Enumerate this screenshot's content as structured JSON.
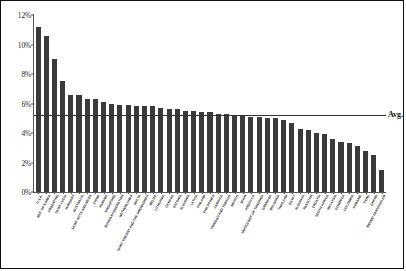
{
  "chart_data": {
    "type": "bar",
    "title": "",
    "xlabel": "",
    "ylabel": "",
    "ylim": [
      0,
      12
    ],
    "ytick_labels": [
      "0%",
      "2%",
      "4%",
      "6%",
      "8%",
      "10%",
      "12%"
    ],
    "ytick_values": [
      0,
      2,
      4,
      6,
      8,
      10,
      12
    ],
    "grid": false,
    "legend": "none",
    "bar_color": "#3a3a3a",
    "annotations": [
      {
        "name": "average-line",
        "label": "Avg. 5.20%",
        "value": 5.2,
        "orientation": "horizontal"
      }
    ],
    "categories": [
      "U.S.A.",
      "REP. OF KOREA",
      "ARGENTINA",
      "SAINT LUCIA",
      "HUNGARY",
      "AUSTRALIA",
      "SAINT KITTS AND NEVIS",
      "CHINA",
      "PANAMA",
      "SINGAPORE",
      "RUSSIAN FEDERATION",
      "NETHERLANDS",
      "MALTA",
      "SAINT VINCENT AND THE GRENADINES",
      "BELIZE",
      "LITHUANIA",
      "CANADA",
      "ESTONIA",
      "SLOVENIA",
      "LATVIA",
      "FINLAND",
      "PHILIPPINES",
      "JAMAICA",
      "TRINIDAD AND TOBAGO",
      "MEXICO",
      "SPAIN",
      "ANGUILLA",
      "UNITED REP. OF TANZANIA",
      "GRENADA",
      "BULGARIA",
      "THAILAND",
      "EGYPT",
      "SLOVAKIA",
      "PAKISTAN",
      "CROATIA",
      "SOUTH AFRICA",
      "MALAYSIA",
      "DOMINICA",
      "COLOMBIA",
      "UKRAINE",
      "PERU",
      "GHANA",
      "BRUNEI DARUSSALAM"
    ],
    "values": [
      11.2,
      10.6,
      9.0,
      7.5,
      6.6,
      6.6,
      6.3,
      6.3,
      6.1,
      6.0,
      5.9,
      5.9,
      5.8,
      5.8,
      5.8,
      5.7,
      5.6,
      5.6,
      5.5,
      5.5,
      5.4,
      5.4,
      5.3,
      5.3,
      5.2,
      5.2,
      5.1,
      5.1,
      5.0,
      5.0,
      4.9,
      4.7,
      4.3,
      4.2,
      4.0,
      3.9,
      3.6,
      3.4,
      3.3,
      3.1,
      2.8,
      2.5,
      1.5
    ]
  }
}
